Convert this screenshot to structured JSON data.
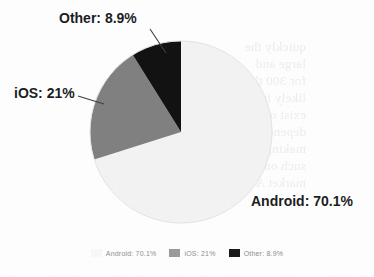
{
  "chart_data": {
    "type": "pie",
    "title": "",
    "categories": [
      "Android",
      "iOS",
      "Other"
    ],
    "values": [
      70.1,
      21,
      8.9
    ],
    "value_unit": "%",
    "slice_labels": [
      "Android: 70.1%",
      "iOS: 21%",
      "Other: 8.9%"
    ],
    "colors": [
      "#f2f2f2",
      "#808080",
      "#121212"
    ],
    "start_angle_deg": 0,
    "direction": "clockwise",
    "legend": {
      "position": "bottom",
      "entries": [
        {
          "label": "Android: 70.1%",
          "color": "#f2f2f2",
          "swatch": "legend-swatch-android"
        },
        {
          "label": "iOS: 21%",
          "color": "#9a9a9a",
          "swatch": "legend-swatch-ios"
        },
        {
          "label": "Other: 8.9%",
          "color": "#1a1a1a",
          "swatch": "legend-swatch-other"
        }
      ]
    },
    "grid": false,
    "labels_outside": true,
    "leader_lines": [
      "other-leader-line",
      "ios-leader-line"
    ]
  },
  "labels": {
    "android": "Android: 70.1%",
    "ios": "iOS: 21%",
    "other": "Other: 8.9%"
  },
  "legend": {
    "android": "Android:  70.1%",
    "ios": "iOS:  21%",
    "other": "Other:  8.9%"
  },
  "colors": {
    "android_slice": "#f2f2f2",
    "ios_slice": "#808080",
    "other_slice": "#121212",
    "label_text": "#1d1d1d",
    "legend_text": "#8e8e90",
    "leader_line": "#4a4a4a",
    "page_background": "#fdfdfd"
  },
  "page": {
    "bleed_through_text": "quickly the\nlarge and\nfor 300 th\nlikely in\nexist on th\ndepend on 300\nmaking for Goog\nsuch on Android\nmarket Android"
  }
}
